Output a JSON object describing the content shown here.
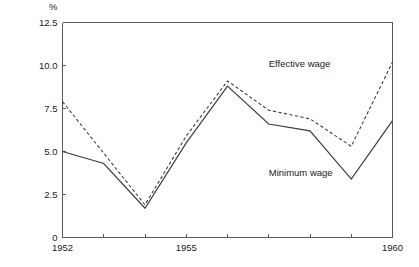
{
  "chart_data": {
    "type": "line",
    "title": "",
    "subtitle": "",
    "xlabel": "",
    "ylabel": "",
    "unit_label": "%",
    "x": [
      1952,
      1953,
      1954,
      1955,
      1956,
      1957,
      1958,
      1959,
      1960
    ],
    "xlim": [
      1952,
      1960
    ],
    "ylim": [
      0,
      12.5
    ],
    "grid": false,
    "legend_position": "inline-annotations",
    "x_tick_values": [
      1952,
      1953,
      1954,
      1955,
      1956,
      1957,
      1958,
      1959,
      1960
    ],
    "x_tick_labels": [
      "1952",
      "",
      "",
      "1955",
      "",
      "",
      "",
      "",
      "1960"
    ],
    "y_tick_values": [
      0,
      2.5,
      5.0,
      7.5,
      10.0,
      12.5
    ],
    "y_tick_labels": [
      "0",
      "2.5",
      "5.0",
      "7.5",
      "10.0",
      "12.5"
    ],
    "series": [
      {
        "name": "Effective wage",
        "style": "dashed",
        "color": "#3c3c3c",
        "x": [
          1952,
          1953,
          1954,
          1955,
          1956,
          1957,
          1958,
          1959,
          1960
        ],
        "values": [
          7.9,
          null,
          1.9,
          5.9,
          9.1,
          7.4,
          6.9,
          5.3,
          10.2
        ],
        "annotation": "Effective wage",
        "annotation_x": 1957.0,
        "annotation_y": 9.9
      },
      {
        "name": "Minimum wage",
        "style": "solid",
        "color": "#3c3c3c",
        "x": [
          1952,
          1953,
          1954,
          1955,
          1956,
          1957,
          1958,
          1959,
          1960
        ],
        "values": [
          5.0,
          4.3,
          1.7,
          5.5,
          8.8,
          6.6,
          6.2,
          3.4,
          6.8
        ],
        "annotation": "Minimum wage",
        "annotation_x": 1957.0,
        "annotation_y": 3.6
      }
    ],
    "annotations": [
      {
        "text": "Effective wage",
        "x": 1957.0,
        "y": 9.9
      },
      {
        "text": "Minimum wage",
        "x": 1957.0,
        "y": 3.6
      }
    ]
  }
}
